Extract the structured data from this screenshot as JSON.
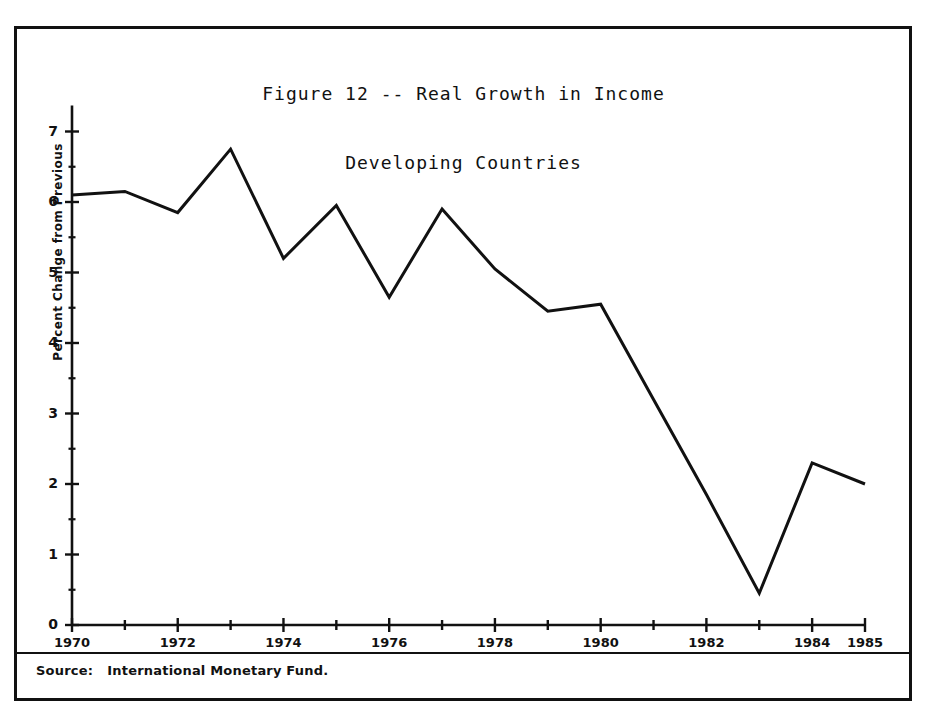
{
  "figure": {
    "title_line1": "Figure 12 -- Real Growth in Income",
    "title_line2": "Developing Countries",
    "source_note": "Source:   International Monetary Fund."
  },
  "chart_data": {
    "type": "line",
    "title": "Figure 12 -- Real Growth in Income Developing Countries",
    "xlabel": "",
    "ylabel": "Percent Change from Previous",
    "xlim": [
      1970,
      1985
    ],
    "ylim": [
      0,
      7
    ],
    "grid": false,
    "legend": "none",
    "x": [
      1970,
      1971,
      1972,
      1973,
      1974,
      1975,
      1976,
      1977,
      1978,
      1979,
      1980,
      1981,
      1982,
      1983,
      1984,
      1985
    ],
    "values": [
      6.1,
      6.15,
      5.85,
      6.75,
      5.2,
      5.95,
      4.65,
      5.9,
      5.05,
      4.45,
      4.55,
      3.2,
      1.85,
      0.45,
      2.3,
      2.0
    ],
    "series": [
      {
        "name": "Real Growth in Income, Developing Countries",
        "values": [
          6.1,
          6.15,
          5.85,
          6.75,
          5.2,
          5.95,
          4.65,
          5.9,
          5.05,
          4.45,
          4.55,
          3.2,
          1.85,
          0.45,
          2.3,
          2.0
        ]
      }
    ],
    "y_major_ticks": [
      0,
      1,
      2,
      3,
      4,
      5,
      6,
      7
    ],
    "y_minor_ticks": [
      0.5,
      1.5,
      2.5,
      3.5,
      4.5,
      5.5,
      6.5
    ],
    "y_tick_labels": [
      "0",
      "1",
      "2",
      "3",
      "4",
      "5",
      "6",
      "7"
    ],
    "x_major_ticks": [
      1970,
      1972,
      1974,
      1976,
      1978,
      1980,
      1982,
      1984,
      1985
    ],
    "x_all_ticks": [
      1970,
      1971,
      1972,
      1973,
      1974,
      1975,
      1976,
      1977,
      1978,
      1979,
      1980,
      1981,
      1982,
      1983,
      1984,
      1985
    ],
    "x_tick_labels": [
      "1970",
      "1972",
      "1974",
      "1976",
      "1978",
      "1980",
      "1982",
      "1984",
      "1985"
    ],
    "line_color": "#111111"
  }
}
